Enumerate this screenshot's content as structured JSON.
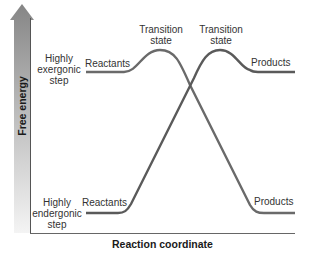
{
  "diagram": {
    "y_axis_label": "Free energy",
    "x_axis_label": "Reaction coordinate",
    "colors": {
      "curve": "#5f5f5f",
      "axis": "#555555",
      "arrow_top": "#8a8a8a",
      "arrow_bottom": "#f2f2f2"
    },
    "exergonic": {
      "step_label_line1": "Highly",
      "step_label_line2": "exergonic",
      "step_label_line3": "step",
      "reactants": "Reactants",
      "transition": "Transition",
      "transition_line2": "state",
      "products": "Products"
    },
    "endergonic": {
      "step_label_line1": "Highly",
      "step_label_line2": "endergonic",
      "step_label_line3": "step",
      "reactants": "Reactants",
      "transition": "Transition",
      "transition_line2": "state",
      "products": "Products"
    }
  }
}
